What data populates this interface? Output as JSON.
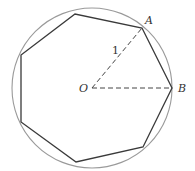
{
  "diagram": {
    "colors": {
      "circle": "#9a9a9a",
      "polygon": "#3a3a3a",
      "dashed": "#444444",
      "label": "#333333"
    },
    "circle": {
      "cx": 92,
      "cy": 88,
      "r": 80
    },
    "center": {
      "x": 92,
      "y": 88,
      "label": "O"
    },
    "polygon_points": "142,28 172,88 143,147 76,162 21,122 21,55 75,14",
    "points": {
      "A": {
        "x": 142,
        "y": 28,
        "label": "A"
      },
      "B": {
        "x": 172,
        "y": 88,
        "label": "B"
      }
    },
    "radius_label": "1"
  }
}
